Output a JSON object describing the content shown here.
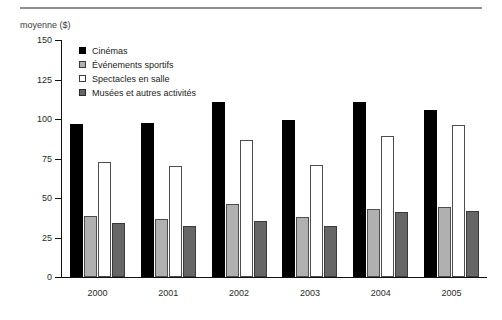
{
  "chart_data": {
    "type": "bar",
    "title": "",
    "subtitle": "",
    "xlabel": "",
    "ylabel": "moyenne ($)",
    "categories": [
      "2000",
      "2001",
      "2002",
      "2003",
      "2004",
      "2005"
    ],
    "series": [
      {
        "name": "Cinémas",
        "color": "#000000",
        "values": [
          97,
          97.5,
          110.5,
          99.5,
          111,
          105.5
        ]
      },
      {
        "name": "Événements sportifs",
        "color": "#b0b0b0",
        "values": [
          38.5,
          37,
          46.5,
          38,
          43,
          44
        ]
      },
      {
        "name": "Spectacles en salle",
        "color": "#ffffff",
        "values": [
          73,
          70,
          86.5,
          71,
          89.5,
          96
        ]
      },
      {
        "name": "Musées et autres activités",
        "color": "#666666",
        "values": [
          34,
          32.5,
          35.5,
          32,
          41,
          41.5
        ]
      }
    ],
    "ylim": [
      0,
      150
    ],
    "yticks": [
      0,
      25,
      50,
      75,
      100,
      125,
      150
    ],
    "ytick_labels": [
      "0",
      "25",
      "50",
      "75",
      "100",
      "125",
      "150"
    ],
    "grid": false,
    "legend_position": "top-left-inside"
  },
  "legend": {
    "entries": [
      {
        "label": "Cinémas"
      },
      {
        "label": "Événements sportifs"
      },
      {
        "label": "Spectacles en salle"
      },
      {
        "label": "Musées et autres activités"
      }
    ]
  }
}
